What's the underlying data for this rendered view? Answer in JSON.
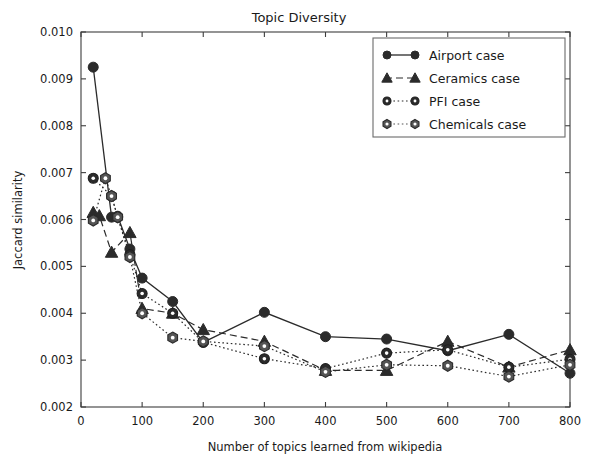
{
  "chart_data": {
    "type": "line",
    "title": "Topic Diversity",
    "xlabel": "Number of topics learned from wikipedia",
    "ylabel": "Jaccard similarity",
    "xlim": [
      0,
      800
    ],
    "ylim": [
      0.002,
      0.01
    ],
    "xticks": [
      0,
      100,
      200,
      300,
      400,
      500,
      600,
      700,
      800
    ],
    "xticklabels": [
      "0",
      "100",
      "200",
      "300",
      "400",
      "500",
      "600",
      "700",
      "800"
    ],
    "yticks": [
      0.002,
      0.003,
      0.004,
      0.005,
      0.006,
      0.007,
      0.008,
      0.009,
      0.01
    ],
    "yticklabels": [
      "0.002",
      "0.003",
      "0.004",
      "0.005",
      "0.006",
      "0.007",
      "0.008",
      "0.009",
      "0.010"
    ],
    "grid": false,
    "legend_position": "upper right",
    "series": [
      {
        "name": "Airport case",
        "marker": "circle-filled",
        "linestyle": "solid",
        "color": "#2b2b2b",
        "x": [
          20,
          50,
          60,
          80,
          100,
          150,
          200,
          300,
          400,
          500,
          600,
          700,
          800
        ],
        "y": [
          0.00925,
          0.00605,
          0.00607,
          0.00537,
          0.00475,
          0.00425,
          0.00338,
          0.00402,
          0.0035,
          0.00345,
          0.0032,
          0.00355,
          0.00272
        ]
      },
      {
        "name": "Ceramics case",
        "marker": "triangle",
        "linestyle": "dashed",
        "color": "#2b2b2b",
        "x": [
          20,
          30,
          50,
          80,
          100,
          150,
          200,
          300,
          400,
          500,
          600,
          700,
          800
        ],
        "y": [
          0.00615,
          0.00608,
          0.0053,
          0.00572,
          0.0041,
          0.004,
          0.00365,
          0.0034,
          0.00278,
          0.00278,
          0.0034,
          0.00285,
          0.00322
        ]
      },
      {
        "name": "PFI case",
        "marker": "circle-dot",
        "linestyle": "dotted",
        "color": "#2b2b2b",
        "x": [
          20,
          50,
          60,
          80,
          100,
          150,
          200,
          300,
          400,
          500,
          600,
          700,
          800
        ],
        "y": [
          0.00688,
          0.0065,
          0.00605,
          0.00525,
          0.00442,
          0.004,
          0.00338,
          0.00303,
          0.00282,
          0.00315,
          0.00322,
          0.00285,
          0.00302
        ]
      },
      {
        "name": "Chemicals case",
        "marker": "hexagon",
        "linestyle": "dotted",
        "color": "#555555",
        "x": [
          20,
          40,
          50,
          60,
          80,
          100,
          150,
          200,
          300,
          400,
          500,
          600,
          700,
          800
        ],
        "y": [
          0.00598,
          0.00688,
          0.0065,
          0.00605,
          0.0052,
          0.004,
          0.00348,
          0.0034,
          0.0033,
          0.00275,
          0.0029,
          0.00288,
          0.00265,
          0.0029
        ]
      }
    ]
  },
  "legend": {
    "entries": [
      {
        "label": "Airport case"
      },
      {
        "label": "Ceramics case"
      },
      {
        "label": "PFI case"
      },
      {
        "label": "Chemicals case"
      }
    ]
  },
  "colors": {
    "background": "#ffffff",
    "axis": "#3d3d3d",
    "text": "#1a1a1a",
    "legend_border": "#6b6b6b"
  }
}
